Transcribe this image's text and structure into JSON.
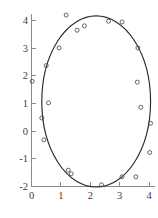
{
  "figure": {
    "name": "scatter-plot-with-fitted-ellipse",
    "background_color": "#ffffff",
    "curve_color": "#2a2a2a",
    "point_color": "#4a4a4a",
    "axis_color": "#8a8a8a",
    "label_color": "#3c3c3c"
  },
  "caption": {
    "ghost_text": "."
  },
  "chart_data": {
    "type": "scatter",
    "title": "",
    "subtitle": "",
    "xlabel": "",
    "ylabel": "",
    "xlim": [
      -0.35,
      4.4
    ],
    "ylim": [
      -2.3,
      4.45
    ],
    "xticks": [
      0,
      1,
      2,
      3,
      4
    ],
    "yticks": [
      -2,
      -1,
      0,
      1,
      2,
      3,
      4
    ],
    "xtick_labels": [
      "0",
      "1",
      "2",
      "3",
      "4"
    ],
    "ytick_labels": [
      "-2",
      "-1",
      "0",
      "1",
      "2",
      "3",
      "4"
    ],
    "grid": false,
    "legend": null,
    "legend_position": "none",
    "marker": "open-circle",
    "series": [
      {
        "name": "observations",
        "marker": "open-circle",
        "points": [
          [
            0.02,
            1.8
          ],
          [
            0.35,
            0.47
          ],
          [
            0.42,
            -0.32
          ],
          [
            0.5,
            2.37
          ],
          [
            0.58,
            1.02
          ],
          [
            0.94,
            3.01
          ],
          [
            1.18,
            4.2
          ],
          [
            1.25,
            -1.42
          ],
          [
            1.35,
            -1.55
          ],
          [
            1.55,
            3.65
          ],
          [
            1.8,
            3.81
          ],
          [
            2.38,
            -1.95
          ],
          [
            2.62,
            3.98
          ],
          [
            3.08,
            3.95
          ],
          [
            3.08,
            -1.66
          ],
          [
            3.55,
            -1.66
          ],
          [
            3.6,
            1.77
          ],
          [
            3.62,
            3.01
          ],
          [
            3.72,
            0.86
          ],
          [
            4.02,
            -0.78
          ],
          [
            4.05,
            0.28
          ]
        ]
      }
    ],
    "fitted_curve": {
      "name": "fitted-ellipse",
      "type": "ellipse",
      "center": [
        2.2,
        1.07
      ],
      "semi_axis_x": 1.85,
      "semi_axis_y": 3.1,
      "rotation_deg": 0
    }
  }
}
